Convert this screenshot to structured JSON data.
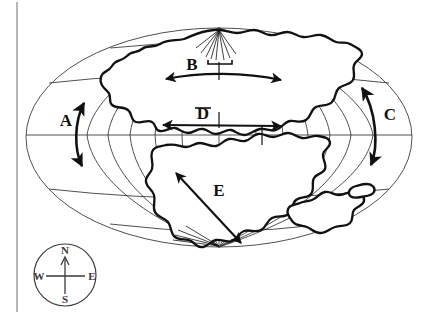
{
  "figure": {
    "name": "pangaea-continental-drift-map",
    "projection_shape": "ellipse-oval-world-map",
    "background_color": "#ffffff",
    "ink_color": "#111111",
    "graticule_color": "#3c3c3c",
    "margin_rule_color": "#9a9a9a"
  },
  "arrows": [
    {
      "id": "A",
      "label": "A",
      "kind": "double-headed-curved-vertical",
      "label_x": 66,
      "label_y": 126,
      "description": "Curved north-south double-headed arrow on the western side of the map"
    },
    {
      "id": "B",
      "label": "B",
      "kind": "double-headed-horizontal",
      "label_x": 192,
      "label_y": 70,
      "description": "East-west double-headed arrow across the northern landmass (Laurasia)"
    },
    {
      "id": "C",
      "label": "C",
      "kind": "double-headed-curved-vertical",
      "label_x": 390,
      "label_y": 120,
      "description": "Curved north-south double-headed arrow on the eastern side of the map"
    },
    {
      "id": "D",
      "label": "D",
      "kind": "double-headed-horizontal",
      "label_x": 203,
      "label_y": 119,
      "description": "East-west double-headed arrow along the equatorial region"
    },
    {
      "id": "E",
      "label": "E",
      "kind": "double-headed-diagonal",
      "label_x": 219,
      "label_y": 196,
      "description": "Northwest-southeast double-headed arrow across the southern landmass (Gondwana)"
    }
  ],
  "compass_rose": {
    "name": "compass-rose",
    "center_x": 65,
    "center_y": 275,
    "radius": 31,
    "points": [
      {
        "label": "N",
        "x": 65,
        "y": 252,
        "direction": "north"
      },
      {
        "label": "E",
        "x": 90,
        "y": 277,
        "direction": "east"
      },
      {
        "label": "S",
        "x": 65,
        "y": 302,
        "direction": "south"
      },
      {
        "label": "W",
        "x": 41,
        "y": 277,
        "direction": "west"
      }
    ]
  },
  "graticule": {
    "latitude_lines": 5,
    "longitude_lines": 11,
    "equator_y": 135,
    "north_pole_y": 28,
    "south_pole_y": 247,
    "left_edge_x": 26,
    "right_edge_x": 412
  }
}
